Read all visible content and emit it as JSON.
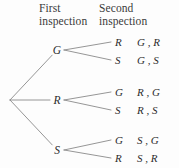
{
  "figure": {
    "name": "probability-tree-diagram",
    "background": "#fdfdfd",
    "line_color": "#8a8a8a",
    "text_color": "#2c2c2c"
  },
  "headers": {
    "first": "First\ninspection",
    "second": "Second\ninspection"
  },
  "root": {
    "x": 10,
    "y": 100
  },
  "branches": [
    {
      "label": "G",
      "x": 57,
      "y": 50,
      "children": [
        {
          "label": "R",
          "x": 115,
          "y": 42,
          "outcome": "G , R",
          "outcome_x": 137
        },
        {
          "label": "S",
          "x": 115,
          "y": 60,
          "outcome": "G , S",
          "outcome_x": 137
        }
      ]
    },
    {
      "label": "R",
      "x": 57,
      "y": 100,
      "children": [
        {
          "label": "G",
          "x": 115,
          "y": 92,
          "outcome": "R , G",
          "outcome_x": 137
        },
        {
          "label": "S",
          "x": 115,
          "y": 110,
          "outcome": "R , S",
          "outcome_x": 137
        }
      ]
    },
    {
      "label": "S",
      "x": 57,
      "y": 150,
      "children": [
        {
          "label": "G",
          "x": 115,
          "y": 140,
          "outcome": "S , G",
          "outcome_x": 137
        },
        {
          "label": "R",
          "x": 115,
          "y": 158,
          "outcome": "S , R",
          "outcome_x": 137
        }
      ]
    }
  ]
}
